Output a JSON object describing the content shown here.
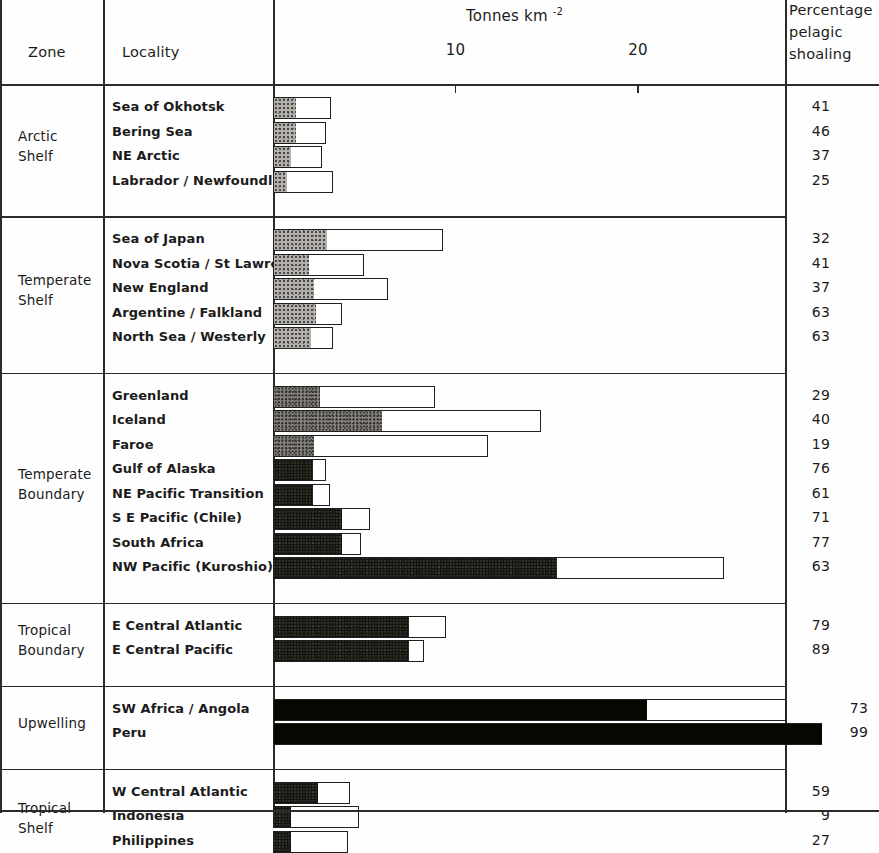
{
  "header": {
    "zone_label": "Zone",
    "locality_label": "Locality",
    "axis_title": "Tonnes km",
    "axis_title_exponent": "-2",
    "percent_label_line1": "Percentage",
    "percent_label_line2": "pelagic",
    "percent_label_line3": "shoaling"
  },
  "axis": {
    "ticks": [
      {
        "label": "10",
        "value": 10
      },
      {
        "label": "20",
        "value": 20
      }
    ],
    "min": 0,
    "max": 31
  },
  "chart_data": {
    "type": "bar",
    "xlabel": "Tonnes km-2",
    "ylabel": "",
    "xlim": [
      0,
      31
    ],
    "grid": false,
    "legend": "none",
    "orientation": "horizontal",
    "note": "Each bar total = total fish biomass (tonnes km-2); shaded left portion = pelagic shoaling fraction given as percentage in right column.",
    "series": [
      {
        "name": "pelagic shoaling portion",
        "fill": "stipple"
      },
      {
        "name": "remainder",
        "fill": "white"
      }
    ],
    "groups": [
      {
        "zone": "Arctic\nShelf",
        "zone_lines": [
          "Arctic",
          "Shelf"
        ],
        "rows": [
          {
            "locality": "Sea of Okhotsk",
            "total": 3.2,
            "percent": 41,
            "shaded": 1.3,
            "shade": "light"
          },
          {
            "locality": "Bering Sea",
            "total": 2.9,
            "percent": 46,
            "shaded": 1.3,
            "shade": "light"
          },
          {
            "locality": "NE Arctic",
            "total": 2.7,
            "percent": 37,
            "shaded": 1.0,
            "shade": "light"
          },
          {
            "locality": "Labrador / Newfoundland",
            "total": 3.3,
            "percent": 25,
            "shaded": 0.8,
            "shade": "light"
          }
        ]
      },
      {
        "zone": "Temperate\nShelf",
        "zone_lines": [
          "Temperate",
          "Shelf"
        ],
        "rows": [
          {
            "locality": "Sea of Japan",
            "total": 9.3,
            "percent": 32,
            "shaded": 3.0,
            "shade": "light"
          },
          {
            "locality": "Nova Scotia / St Lawrence",
            "total": 5.0,
            "percent": 41,
            "shaded": 2.0,
            "shade": "light"
          },
          {
            "locality": "New England",
            "total": 6.3,
            "percent": 37,
            "shaded": 2.3,
            "shade": "light"
          },
          {
            "locality": "Argentine / Falkland",
            "total": 3.8,
            "percent": 63,
            "shaded": 2.4,
            "shade": "light"
          },
          {
            "locality": "North Sea / Westerly",
            "total": 3.3,
            "percent": 63,
            "shaded": 2.1,
            "shade": "light"
          }
        ]
      },
      {
        "zone": "Temperate\nBoundary",
        "zone_lines": [
          "Temperate",
          "Boundary"
        ],
        "rows": [
          {
            "locality": "Greenland",
            "total": 8.9,
            "percent": 29,
            "shaded": 2.6,
            "shade": "mid"
          },
          {
            "locality": "Iceland",
            "total": 14.7,
            "percent": 40,
            "shaded": 6.0,
            "shade": "mid"
          },
          {
            "locality": "Faroe",
            "total": 11.8,
            "percent": 19,
            "shaded": 2.3,
            "shade": "mid"
          },
          {
            "locality": "Gulf of Alaska",
            "total": 2.9,
            "percent": 76,
            "shaded": 2.2,
            "shade": "dark"
          },
          {
            "locality": "NE Pacific Transition",
            "total": 3.1,
            "percent": 61,
            "shaded": 2.2,
            "shade": "dark"
          },
          {
            "locality": "S E Pacific (Chile)",
            "total": 5.3,
            "percent": 71,
            "shaded": 3.8,
            "shade": "dark"
          },
          {
            "locality": "South Africa",
            "total": 4.8,
            "percent": 77,
            "shaded": 3.8,
            "shade": "dark"
          },
          {
            "locality": "NW Pacific (Kuroshio)",
            "total": 24.7,
            "percent": 63,
            "shaded": 15.6,
            "shade": "dark"
          }
        ]
      },
      {
        "zone": "Tropical\nBoundary",
        "zone_lines": [
          "Tropical",
          "Boundary"
        ],
        "rows": [
          {
            "locality": "E Central Atlantic",
            "total": 9.5,
            "percent": 79,
            "shaded": 7.5,
            "shade": "dark"
          },
          {
            "locality": "E Central Pacific",
            "total": 8.3,
            "percent": 89,
            "shaded": 7.5,
            "shade": "dark"
          }
        ]
      },
      {
        "zone": "Upwelling",
        "zone_lines": [
          "Upwelling"
        ],
        "rows": [
          {
            "locality": "SW Africa / Angola",
            "total": 28.1,
            "percent": 73,
            "shaded": 20.5,
            "shade": "vdark"
          },
          {
            "locality": "Peru",
            "total": 30.1,
            "percent": 99,
            "shaded": 30.1,
            "shade": "vdark"
          }
        ]
      },
      {
        "zone": "Tropical\nShelf",
        "zone_lines": [
          "Tropical",
          "Shelf"
        ],
        "rows": [
          {
            "locality": "W Central Atlantic",
            "total": 4.2,
            "percent": 59,
            "shaded": 2.5,
            "shade": "dark"
          },
          {
            "locality": "Indonesia",
            "total": 4.7,
            "percent": 9,
            "shaded": 1.0,
            "shade": "dark"
          },
          {
            "locality": "Philippines",
            "total": 4.1,
            "percent": 27,
            "shaded": 1.0,
            "shade": "dark"
          }
        ]
      }
    ]
  }
}
